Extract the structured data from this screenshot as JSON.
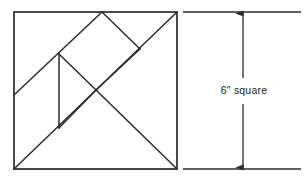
{
  "figure": {
    "line_color": "#2b2b2b",
    "background_color": "#ffffff",
    "square": {
      "name": "tangram-square",
      "left": 14,
      "top": 12,
      "right": 177,
      "bottom": 169,
      "side_label": "6\" square"
    },
    "tangram_pieces": [
      {
        "name": "main-diagonal",
        "points": "14,169 177,12"
      },
      {
        "name": "upper-left-diagonal",
        "points": "14,95 102,12"
      },
      {
        "name": "apex-to-vertex",
        "points": "102,12 140,49"
      },
      {
        "name": "vertex-to-center",
        "points": "140,49 96,90"
      },
      {
        "name": "small-triangle-hypotenuse",
        "points": "59,54 96,90"
      },
      {
        "name": "center-to-bottom-diagonal",
        "points": "96,90 59,128"
      },
      {
        "name": "vertical-divider",
        "points": "59,54 59,128"
      },
      {
        "name": "center-to-bottom-right",
        "points": "96,90 177,169"
      }
    ]
  },
  "dimension": {
    "name": "height-dimension",
    "label": "6\" square",
    "label_x": 244,
    "label_y": 94,
    "arrow_x": 243,
    "arrow_top_y": 12,
    "arrow_bottom_y": 169,
    "extension_lines": [
      {
        "name": "top-extension-line",
        "x1": 183,
        "y": 12,
        "x2": 301
      },
      {
        "name": "bottom-extension-line",
        "x1": 183,
        "y": 169,
        "x2": 301
      }
    ],
    "gap_top_y": 78,
    "gap_bottom_y": 104
  }
}
